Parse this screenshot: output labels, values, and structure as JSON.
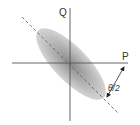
{
  "diagram": {
    "axes": {
      "horizontal_label": "P",
      "vertical_label": "Q"
    },
    "angle_label": "θ/2",
    "colors": {
      "axis": "#555555",
      "ellipse_outer": "#d4d4d4",
      "ellipse_inner": "#8a8a8a",
      "dashed_line": "#666666",
      "text": "#333333"
    },
    "elements": [
      "ellipse",
      "dashed-major-axis",
      "p-axis",
      "q-axis",
      "angle-arrow"
    ]
  }
}
